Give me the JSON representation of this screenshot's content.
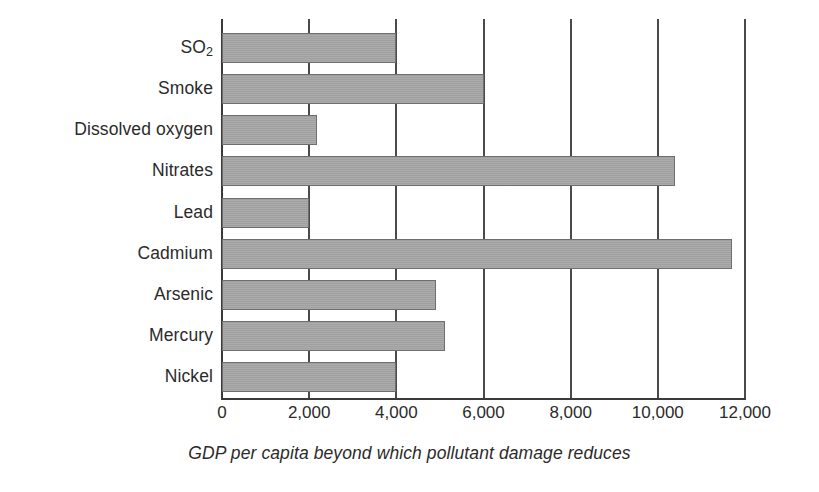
{
  "chart_data": {
    "type": "bar",
    "orientation": "horizontal",
    "title": "",
    "subtitle": "",
    "xlabel": "GDP per capita beyond which pollutant damage reduces",
    "ylabel": "",
    "categories": [
      "SO2",
      "Smoke",
      "Dissolved oxygen",
      "Nitrates",
      "Lead",
      "Cadmium",
      "Arsenic",
      "Mercury",
      "Nickel"
    ],
    "category_labels_html": [
      "SO<sub>2</sub>",
      "Smoke",
      "Dissolved oxygen",
      "Nitrates",
      "Lead",
      "Cadmium",
      "Arsenic",
      "Mercury",
      "Nickel"
    ],
    "values": [
      4000,
      6000,
      2190,
      10390,
      2000,
      11700,
      4910,
      5110,
      4000
    ],
    "xlim": [
      0,
      12000
    ],
    "xticks": [
      0,
      2000,
      4000,
      6000,
      8000,
      10000,
      12000
    ],
    "xtick_labels": [
      "0",
      "2,000",
      "4,000",
      "6,000",
      "8,000",
      "10,000",
      "12,000"
    ],
    "grid": "vertical-only",
    "legend": "none",
    "bar_color": "#a6a6a6",
    "bar_edge_color": "#6e6e6e",
    "axis_color": "#3a3a3a",
    "background_color": "#ffffff",
    "text_color": "#2b2b2b"
  }
}
